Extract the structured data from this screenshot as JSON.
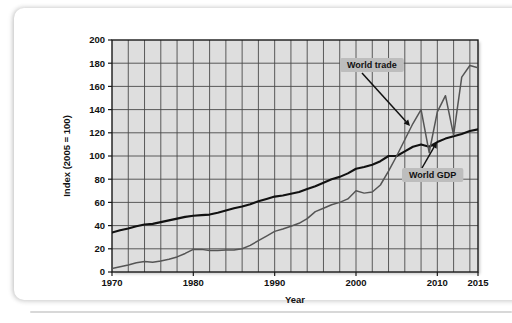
{
  "figure": {
    "background_color": "#ffffff",
    "plot_background_color": "#dedede",
    "grid_color": "#4a4a4a",
    "axis_color": "#1a1a1a"
  },
  "chart_data": {
    "type": "line",
    "title": "",
    "xlabel": "Year",
    "ylabel": "Index (2005 = 100)",
    "xlim": [
      1970,
      2015
    ],
    "ylim": [
      0,
      200
    ],
    "ytick_step": 20,
    "yticks": [
      0,
      20,
      40,
      60,
      80,
      100,
      120,
      140,
      160,
      180,
      200
    ],
    "xticks": [
      1970,
      1980,
      1990,
      2000,
      2010,
      2015
    ],
    "xtick_labels": [
      "1970",
      "1980",
      "1990",
      "2000",
      "2010",
      "2015"
    ],
    "ytick_labels": [
      "0",
      "20",
      "40",
      "60",
      "80",
      "100",
      "120",
      "140",
      "160",
      "180",
      "200"
    ],
    "grid": true,
    "grid_x_step_years": 2,
    "legend": "none",
    "annotations": [
      {
        "name": "world-trade",
        "text": "World trade",
        "box_x": 340,
        "box_y": 58,
        "arrow_from_x": 362,
        "arrow_from_y": 73,
        "arrow_to_x": 410,
        "arrow_to_y": 126
      },
      {
        "name": "world-gdp",
        "text": "World GDP",
        "box_x": 402,
        "box_y": 168,
        "arrow_from_x": 422,
        "arrow_from_y": 168,
        "arrow_to_x": 437,
        "arrow_to_y": 142
      }
    ],
    "series": [
      {
        "name": "World GDP",
        "color": "#111111",
        "width": 2.1,
        "x": [
          1970,
          1971,
          1972,
          1973,
          1974,
          1975,
          1976,
          1977,
          1978,
          1979,
          1980,
          1981,
          1982,
          1983,
          1984,
          1985,
          1986,
          1987,
          1988,
          1989,
          1990,
          1991,
          1992,
          1993,
          1994,
          1995,
          1996,
          1997,
          1998,
          1999,
          2000,
          2001,
          2002,
          2003,
          2004,
          2005,
          2006,
          2007,
          2008,
          2009,
          2010,
          2011,
          2012,
          2013,
          2014,
          2015
        ],
        "values": [
          34,
          36,
          37.5,
          39.5,
          41,
          41.5,
          43,
          44.5,
          46,
          47.5,
          48.5,
          49,
          49.5,
          51,
          53,
          55,
          56.5,
          58.5,
          61,
          63,
          65,
          66,
          67.5,
          69,
          71.5,
          74,
          77,
          80,
          82,
          85,
          89,
          90.5,
          92.5,
          95.5,
          100,
          100,
          104,
          108,
          110,
          108,
          112,
          115,
          117,
          119,
          121.5,
          123
        ]
      },
      {
        "name": "World trade",
        "color": "#555555",
        "width": 1.5,
        "x": [
          1970,
          1971,
          1972,
          1973,
          1974,
          1975,
          1976,
          1977,
          1978,
          1979,
          1980,
          1981,
          1982,
          1983,
          1984,
          1985,
          1986,
          1987,
          1988,
          1989,
          1990,
          1991,
          1992,
          1993,
          1994,
          1995,
          1996,
          1997,
          1998,
          1999,
          2000,
          2001,
          2002,
          2003,
          2004,
          2005,
          2006,
          2007,
          2008,
          2009,
          2010,
          2011,
          2012,
          2013,
          2014,
          2015
        ],
        "values": [
          3,
          4.5,
          6,
          8,
          9,
          8.5,
          9.5,
          11,
          13,
          16,
          19.5,
          19.5,
          18.5,
          18.5,
          19,
          19,
          20,
          23,
          27,
          31,
          35,
          37,
          39.5,
          42,
          46,
          52,
          55,
          58,
          60,
          63,
          70,
          68,
          69,
          75,
          87,
          100,
          114,
          128,
          140,
          103,
          138,
          152,
          118,
          168,
          178,
          176
        ]
      }
    ]
  }
}
